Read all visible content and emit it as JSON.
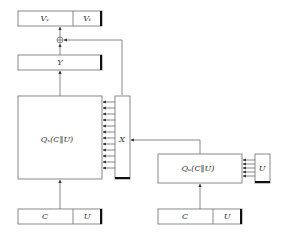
{
  "diagram": {
    "type": "block-diagram",
    "nodes": {
      "v_output": {
        "left_label": "Vᵥ",
        "right_label": "Vₜ"
      },
      "y": {
        "label": "Y"
      },
      "qx": {
        "label": "Qₓ(C‖U)"
      },
      "x": {
        "label": "X"
      },
      "qu": {
        "label": "Qᵤ(C‖U)"
      },
      "u_side": {
        "label": "U"
      },
      "left_input": {
        "left_label": "C",
        "right_label": "U"
      },
      "right_input": {
        "left_label": "C",
        "right_label": "U"
      },
      "xor": {
        "symbol": "⊕"
      }
    },
    "edges": [
      {
        "from": "left_input",
        "to": "qx"
      },
      {
        "from": "qx",
        "to": "y"
      },
      {
        "from": "y",
        "to": "xor"
      },
      {
        "from": "x",
        "to": "xor"
      },
      {
        "from": "xor",
        "to": "v_output"
      },
      {
        "from": "x",
        "to": "qx",
        "count": 12
      },
      {
        "from": "qu",
        "to": "x"
      },
      {
        "from": "u_side",
        "to": "qu",
        "count": 5
      },
      {
        "from": "right_input",
        "to": "qu"
      }
    ]
  }
}
